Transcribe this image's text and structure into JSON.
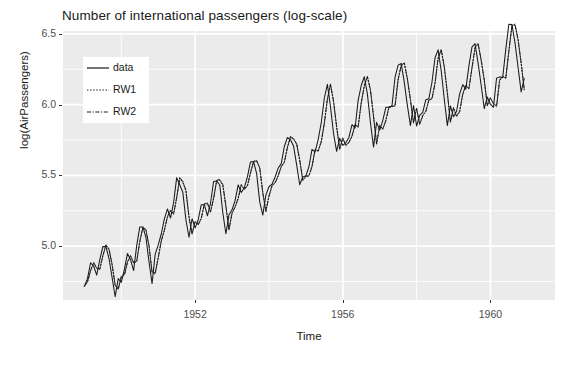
{
  "chart": {
    "title": "Number of international passengers (log-scale)",
    "xlabel": "Time",
    "ylabel": "log(AirPassengers)",
    "panel_bg": "#ebebeb",
    "grid_color": "#ffffff",
    "line_color": "#1a1a1a"
  },
  "axes": {
    "y_ticks": [
      "5.0",
      "5.5",
      "6.0",
      "6.5"
    ],
    "x_ticks": [
      "1952",
      "1956",
      "1960"
    ]
  },
  "legend": {
    "items": [
      {
        "label": "data",
        "style": "solid"
      },
      {
        "label": "RW1",
        "style": "dotted"
      },
      {
        "label": "RW2",
        "style": "dashdot"
      }
    ]
  },
  "chart_data": {
    "type": "line",
    "title": "Number of international passengers (log-scale)",
    "xlabel": "Time",
    "ylabel": "log(AirPassengers)",
    "xlim": [
      1948.42,
      1961.75
    ],
    "ylim": [
      4.62,
      6.52
    ],
    "grid": true,
    "legend_position": "top-left-inside",
    "x_ticks": [
      1952,
      1956,
      1960
    ],
    "y_ticks": [
      5.0,
      5.5,
      6.0,
      6.5
    ],
    "x_start": 1949.0,
    "x_step": 0.0833333,
    "series": [
      {
        "name": "data",
        "style": "solid",
        "values": [
          4.718,
          4.771,
          4.883,
          4.86,
          4.796,
          4.905,
          4.997,
          4.997,
          4.913,
          4.779,
          4.644,
          4.771,
          4.745,
          4.836,
          4.949,
          4.905,
          4.828,
          5.004,
          5.136,
          5.136,
          5.063,
          4.89,
          4.736,
          4.942,
          5.009,
          5.088,
          5.193,
          5.263,
          5.199,
          5.308,
          5.484,
          5.434,
          5.38,
          5.187,
          5.063,
          5.194,
          5.129,
          5.187,
          5.293,
          5.293,
          5.215,
          5.303,
          5.457,
          5.46,
          5.434,
          5.236,
          5.088,
          5.22,
          5.257,
          5.323,
          5.433,
          5.379,
          5.414,
          5.489,
          5.595,
          5.598,
          5.513,
          5.313,
          5.22,
          5.361,
          5.42,
          5.438,
          5.489,
          5.552,
          5.583,
          5.704,
          5.768,
          5.752,
          5.707,
          5.575,
          5.434,
          5.489,
          5.497,
          5.561,
          5.684,
          5.666,
          5.753,
          5.872,
          6.045,
          6.143,
          5.986,
          5.796,
          5.67,
          5.762,
          5.712,
          5.73,
          5.768,
          5.858,
          5.835,
          6.03,
          6.135,
          6.197,
          6.076,
          5.874,
          5.7,
          5.875,
          5.82,
          5.887,
          5.981,
          5.982,
          5.991,
          6.195,
          6.279,
          6.291,
          6.157,
          5.995,
          5.852,
          5.994,
          5.849,
          5.924,
          5.945,
          6.035,
          6.042,
          6.158,
          6.331,
          6.387,
          6.239,
          6.04,
          5.852,
          5.991,
          5.914,
          5.953,
          6.076,
          6.141,
          6.109,
          6.272,
          6.406,
          6.431,
          6.291,
          6.137,
          5.971,
          6.054,
          6.003,
          5.981,
          6.187,
          6.196,
          6.192,
          6.392,
          6.568,
          6.565,
          6.435,
          6.262,
          6.09,
          6.185
        ]
      },
      {
        "name": "RW1",
        "style": "dotted",
        "values": [
          4.718,
          4.75,
          4.83,
          4.88,
          4.842,
          4.84,
          4.935,
          5.005,
          4.975,
          4.869,
          4.727,
          4.7,
          4.782,
          4.8,
          4.89,
          4.93,
          4.88,
          4.895,
          5.035,
          5.13,
          5.11,
          5.0,
          4.82,
          4.81,
          4.915,
          5.035,
          5.115,
          5.205,
          5.25,
          5.23,
          5.345,
          5.48,
          5.45,
          5.39,
          5.21,
          5.09,
          5.17,
          5.155,
          5.2,
          5.295,
          5.3,
          5.245,
          5.34,
          5.46,
          5.465,
          5.43,
          5.28,
          5.12,
          5.23,
          5.28,
          5.34,
          5.43,
          5.405,
          5.43,
          5.52,
          5.595,
          5.6,
          5.55,
          5.38,
          5.25,
          5.35,
          5.425,
          5.45,
          5.5,
          5.56,
          5.595,
          5.7,
          5.77,
          5.755,
          5.72,
          5.605,
          5.47,
          5.49,
          5.5,
          5.565,
          5.68,
          5.675,
          5.74,
          5.87,
          6.035,
          6.14,
          6.02,
          5.84,
          5.69,
          5.76,
          5.715,
          5.735,
          5.775,
          5.855,
          5.845,
          6.015,
          6.13,
          6.195,
          6.1,
          5.915,
          5.725,
          5.85,
          5.83,
          5.89,
          5.98,
          5.985,
          5.995,
          6.18,
          6.275,
          6.29,
          6.18,
          6.03,
          5.875,
          5.97,
          5.865,
          5.925,
          5.95,
          6.03,
          6.045,
          6.155,
          6.325,
          6.385,
          6.265,
          6.08,
          5.88,
          5.975,
          5.92,
          5.955,
          6.07,
          6.135,
          6.115,
          6.26,
          6.4,
          6.428,
          6.31,
          6.17,
          5.995,
          6.045,
          6.01,
          5.99,
          6.17,
          6.195,
          6.19,
          6.38,
          6.555,
          6.562,
          6.455,
          6.29,
          6.11
        ]
      },
      {
        "name": "RW2",
        "style": "dashdot",
        "values": [
          4.718,
          4.745,
          4.825,
          4.885,
          4.848,
          4.836,
          4.93,
          5.01,
          4.982,
          4.873,
          4.722,
          4.694,
          4.788,
          4.795,
          4.885,
          4.935,
          4.886,
          4.89,
          5.03,
          5.135,
          5.118,
          5.006,
          4.814,
          4.804,
          4.922,
          5.04,
          5.11,
          5.21,
          5.256,
          5.225,
          5.34,
          5.486,
          5.458,
          5.396,
          5.204,
          5.084,
          5.176,
          5.15,
          5.195,
          5.3,
          5.306,
          5.24,
          5.335,
          5.465,
          5.472,
          5.436,
          5.286,
          5.114,
          5.236,
          5.275,
          5.335,
          5.436,
          5.4,
          5.425,
          5.515,
          5.6,
          5.606,
          5.556,
          5.374,
          5.244,
          5.356,
          5.43,
          5.445,
          5.495,
          5.565,
          5.59,
          5.695,
          5.776,
          5.76,
          5.726,
          5.612,
          5.464,
          5.496,
          5.495,
          5.56,
          5.685,
          5.67,
          5.735,
          5.866,
          6.04,
          6.146,
          6.026,
          5.846,
          5.684,
          5.766,
          5.71,
          5.73,
          5.78,
          5.86,
          5.84,
          6.01,
          6.135,
          6.2,
          6.106,
          5.92,
          5.72,
          5.856,
          5.825,
          5.885,
          5.985,
          5.99,
          5.99,
          6.176,
          6.28,
          6.295,
          6.186,
          6.036,
          5.87,
          5.976,
          5.86,
          5.92,
          5.955,
          6.035,
          6.04,
          6.15,
          6.33,
          6.39,
          6.27,
          6.086,
          5.874,
          5.98,
          5.915,
          5.95,
          6.075,
          6.14,
          6.11,
          6.255,
          6.405,
          6.434,
          6.316,
          6.176,
          5.99,
          6.05,
          6.005,
          5.985,
          6.175,
          6.2,
          6.185,
          6.375,
          6.56,
          6.568,
          6.46,
          6.296,
          6.105
        ]
      }
    ]
  }
}
